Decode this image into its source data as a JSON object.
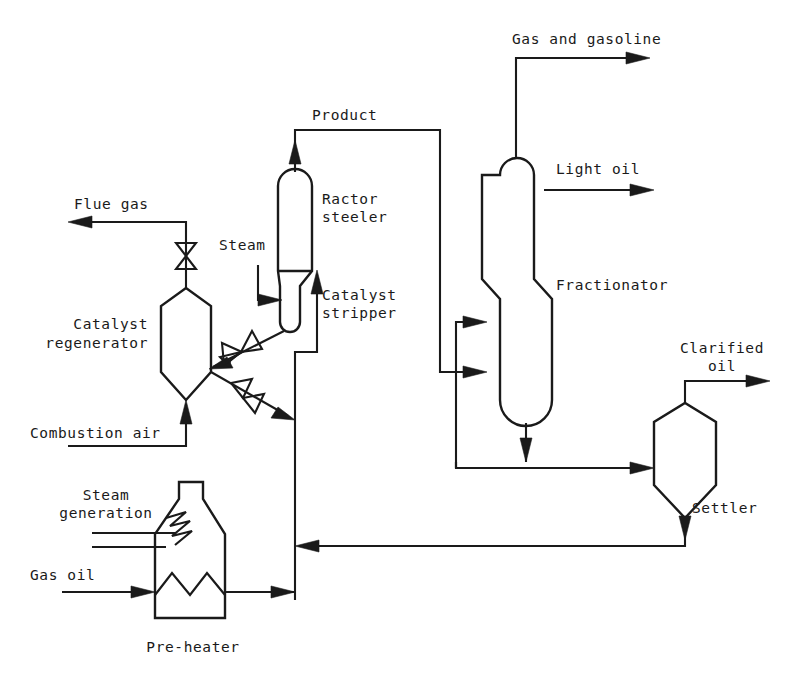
{
  "diagram": {
    "stroke_color": "#1a1a1a",
    "background_color": "#ffffff",
    "equipment": [
      {
        "id": "catalyst-regenerator",
        "label": "Catalyst\nregenerator",
        "label_line1": "Catalyst",
        "label_line2": "regenerator",
        "shape": "octagonal-vessel"
      },
      {
        "id": "reactor-steeler",
        "label": "Ractor\nsteeler",
        "label_line1": "Ractor",
        "label_line2": "steeler",
        "shape": "vertical-capsule"
      },
      {
        "id": "catalyst-stripper",
        "label": "Catalyst\nstripper",
        "label_line1": "Catalyst",
        "label_line2": "stripper",
        "shape": "small-capsule"
      },
      {
        "id": "fractionator",
        "label": "Fractionator",
        "shape": "stepped-column"
      },
      {
        "id": "settler",
        "label": "Settler",
        "shape": "hexagonal-vessel"
      },
      {
        "id": "pre-heater",
        "label": "Pre-heater",
        "shape": "furnace-with-stack"
      }
    ],
    "streams": [
      {
        "id": "flue-gas",
        "label": "Flue gas",
        "direction": "out",
        "from": "catalyst-regenerator"
      },
      {
        "id": "combustion-air",
        "label": "Combustion air",
        "direction": "in",
        "to": "catalyst-regenerator"
      },
      {
        "id": "steam",
        "label": "Steam",
        "direction": "in",
        "to": "catalyst-stripper"
      },
      {
        "id": "product",
        "label": "Product",
        "direction": "internal",
        "from": "reactor-steeler",
        "to": "fractionator"
      },
      {
        "id": "gas-and-gasoline",
        "label": "Gas and gasoline",
        "direction": "out",
        "from": "fractionator"
      },
      {
        "id": "light-oil",
        "label": "Light oil",
        "direction": "out",
        "from": "fractionator"
      },
      {
        "id": "clarified-oil",
        "label": "Clarified\noil",
        "label_line1": "Clarified",
        "label_line2": "oil",
        "direction": "out",
        "from": "settler"
      },
      {
        "id": "steam-generation",
        "label": "Steam\ngeneration",
        "label_line1": "Steam",
        "label_line2": "generation",
        "direction": "in",
        "to": "pre-heater"
      },
      {
        "id": "gas-oil",
        "label": "Gas oil",
        "direction": "in",
        "to": "pre-heater"
      }
    ],
    "labels": {
      "flue_gas": "Flue gas",
      "catalyst_regenerator_l1": "Catalyst",
      "catalyst_regenerator_l2": "regenerator",
      "combustion_air": "Combustion air",
      "steam": "Steam",
      "product": "Product",
      "reactor_l1": "Ractor",
      "reactor_l2": "steeler",
      "stripper_l1": "Catalyst",
      "stripper_l2": "stripper",
      "gas_and_gasoline": "Gas and gasoline",
      "light_oil": "Light oil",
      "fractionator": "Fractionator",
      "clarified_l1": "Clarified",
      "clarified_l2": "oil",
      "settler": "Settler",
      "steam_generation_l1": "Steam",
      "steam_generation_l2": "generation",
      "gas_oil": "Gas oil",
      "pre_heater": "Pre-heater"
    },
    "valves": [
      {
        "id": "flue-gas-valve",
        "orientation": "vertical"
      },
      {
        "id": "spent-catalyst-valve",
        "orientation": "diagonal"
      },
      {
        "id": "regenerated-catalyst-valve",
        "orientation": "diagonal"
      }
    ]
  }
}
